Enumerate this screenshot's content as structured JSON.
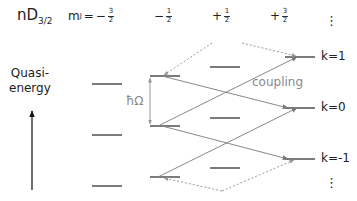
{
  "header": {
    "state_label": "nD",
    "state_subscript": "3/2",
    "mj_prefix": "m",
    "mj_sub": "J",
    "mj_eq": "=",
    "columns": [
      {
        "sign": "−",
        "num": "3",
        "den": "2"
      },
      {
        "sign": "−",
        "num": "1",
        "den": "2"
      },
      {
        "sign": "+",
        "num": "1",
        "den": "2"
      },
      {
        "sign": "+",
        "num": "3",
        "den": "2"
      }
    ],
    "ellipsis": "⋮"
  },
  "axis": {
    "label_line1": "Quasi-",
    "label_line2": "energy",
    "arrow_icon": "up-arrow-icon"
  },
  "annotations": {
    "hbar_omega": "ħΩ",
    "coupling": "coupling"
  },
  "k_labels": [
    "k=1",
    "k=0",
    "k=-1"
  ],
  "bottom_ellipsis": "⋮",
  "colors": {
    "level": "#333333",
    "arrow": "#888888",
    "dashed": "#999999",
    "text": "#222222",
    "annotation": "#888888"
  }
}
